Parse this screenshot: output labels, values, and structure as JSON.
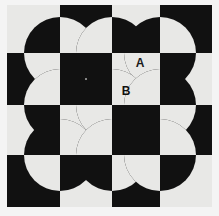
{
  "figure": {
    "canvas": {
      "width": 219,
      "height": 216
    },
    "colors": {
      "background": "#f4f4f4",
      "dark": "#111111",
      "light": "#e8e8e6",
      "label_on_light": "#111111",
      "label_on_dark": "#1a1a1a"
    },
    "grid": {
      "x_lines": [
        7,
        60,
        112,
        160,
        212
      ],
      "y_lines": [
        5,
        53,
        105,
        155,
        207
      ],
      "columns": 4,
      "rows": 4,
      "top_left_cell_color": "light"
    },
    "circles": {
      "radius": 36,
      "centers": [
        {
          "cx": 60,
          "cy": 53
        },
        {
          "cx": 112,
          "cy": 53
        },
        {
          "cx": 160,
          "cy": 53
        },
        {
          "cx": 60,
          "cy": 105
        },
        {
          "cx": 112,
          "cy": 105
        },
        {
          "cx": 160,
          "cy": 105
        },
        {
          "cx": 60,
          "cy": 155
        },
        {
          "cx": 112,
          "cy": 155
        },
        {
          "cx": 160,
          "cy": 155
        }
      ]
    },
    "labels": [
      {
        "id": "label-a",
        "text": "A",
        "x": 140,
        "y": 67,
        "on": "dark"
      },
      {
        "id": "label-b",
        "text": "B",
        "x": 126,
        "y": 95,
        "on": "light"
      },
      {
        "id": "label-c",
        "text": "C",
        "x": 146,
        "y": 145,
        "on": "light"
      }
    ]
  },
  "chart_data": {
    "type": "diagram",
    "xlabel": "",
    "ylabel": "",
    "annotations": [
      "A",
      "B",
      "C"
    ]
  }
}
